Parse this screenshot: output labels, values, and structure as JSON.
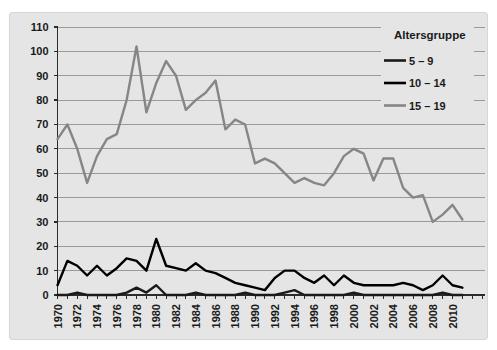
{
  "chart_data": {
    "type": "line",
    "title": "",
    "legend_title": "Altersgruppe",
    "legend_position": "top-right",
    "grid": true,
    "xlabel": "",
    "ylabel": "",
    "ylim": [
      0,
      110
    ],
    "ytick_step": 10,
    "xtick_label_step": 2,
    "x": [
      1970,
      1971,
      1972,
      1973,
      1974,
      1975,
      1976,
      1977,
      1978,
      1979,
      1980,
      1981,
      1982,
      1983,
      1984,
      1985,
      1986,
      1987,
      1988,
      1989,
      1990,
      1991,
      1992,
      1993,
      1994,
      1995,
      1996,
      1997,
      1998,
      1999,
      2000,
      2001,
      2002,
      2003,
      2004,
      2005,
      2006,
      2007,
      2008,
      2009,
      2010,
      2011
    ],
    "series": [
      {
        "name": "5 – 9",
        "color": "#1a1a1a",
        "values": [
          0,
          0,
          1,
          0,
          0,
          0,
          0,
          1,
          3,
          1,
          4,
          0,
          0,
          0,
          1,
          0,
          0,
          0,
          0,
          1,
          0,
          0,
          0,
          1,
          2,
          0,
          0,
          0,
          0,
          0,
          1,
          0,
          0,
          0,
          0,
          0,
          0,
          0,
          0,
          1,
          0,
          0
        ]
      },
      {
        "name": "10 – 14",
        "color": "#000000",
        "values": [
          4,
          14,
          12,
          8,
          12,
          8,
          11,
          15,
          14,
          10,
          23,
          12,
          11,
          10,
          13,
          10,
          9,
          7,
          5,
          4,
          3,
          2,
          7,
          10,
          10,
          7,
          5,
          8,
          4,
          8,
          5,
          4,
          4,
          4,
          4,
          5,
          4,
          2,
          4,
          8,
          4,
          3
        ]
      },
      {
        "name": "15 – 19",
        "color": "#868686",
        "values": [
          64,
          70,
          60,
          46,
          57,
          64,
          66,
          80,
          102,
          75,
          87,
          96,
          90,
          76,
          80,
          83,
          88,
          68,
          72,
          70,
          54,
          56,
          54,
          50,
          46,
          48,
          46,
          45,
          50,
          57,
          60,
          58,
          47,
          56,
          56,
          44,
          40,
          41,
          30,
          33,
          37,
          31
        ]
      }
    ],
    "colors": {
      "panel_bg": "#e5e5e5",
      "grid": "#9a9a9a",
      "axis": "#2b2b2b",
      "text": "#1a1a1a"
    }
  }
}
